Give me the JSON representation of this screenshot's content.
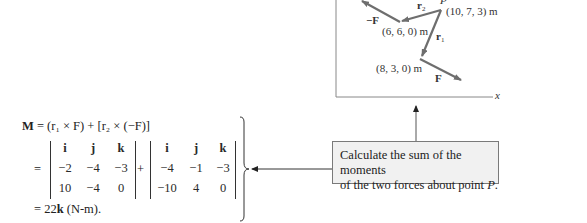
{
  "figure": {
    "axis_label_x": "x",
    "point_P": "P",
    "point_P_coords": "(10, 7, 3) m",
    "point_A_coords": "(6, 6, 0) m",
    "point_B_coords": "(8, 3, 0) m",
    "vector_r1": "r",
    "vector_r1_sub": "1",
    "vector_r2": "r",
    "vector_r2_sub": "2",
    "force_F": "F",
    "force_negF": "−F"
  },
  "equation": {
    "line1_M": "M",
    "line1_rest": " = (r₁ × F) + [r₂ × (−F)]",
    "equals": "=",
    "plus": "+",
    "det1": {
      "row1": [
        "i",
        "j",
        "k"
      ],
      "row2": [
        "−2",
        "−4",
        "−3"
      ],
      "row3": [
        "10",
        "−4",
        "0"
      ]
    },
    "det2": {
      "row1": [
        "i",
        "j",
        "k"
      ],
      "row2": [
        "−4",
        "−1",
        "−3"
      ],
      "row3": [
        "−10",
        "4",
        "0"
      ]
    },
    "result_prefix": "= 22",
    "result_k": "k",
    "result_suffix": " (N-m)."
  },
  "callout": {
    "line1": "Calculate the sum of the moments",
    "line2_prefix": "of the two forces about point ",
    "line2_P": "P",
    "line2_suffix": "."
  },
  "colors": {
    "vector_gray": "#6e6e6e",
    "callout_fill": "#f1f1f1",
    "callout_border": "#7a7a7a"
  }
}
